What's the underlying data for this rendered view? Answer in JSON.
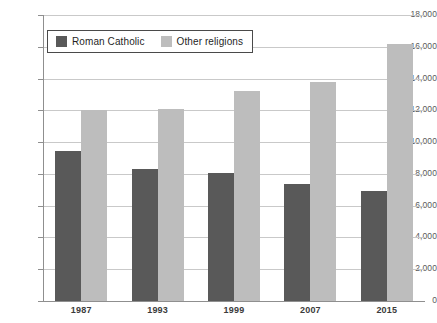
{
  "chart_data": {
    "type": "bar",
    "title": "",
    "xlabel": "",
    "ylabel": "",
    "categories": [
      "1987",
      "1993",
      "1999",
      "2007",
      "2015"
    ],
    "series": [
      {
        "name": "Roman Catholic",
        "color": "#595959",
        "values": [
          9450,
          8300,
          8050,
          7350,
          6900
        ]
      },
      {
        "name": "Other religions",
        "color": "#bdbdbd",
        "values": [
          12050,
          12100,
          13200,
          13800,
          16150
        ]
      }
    ],
    "ylim": [
      0,
      18000
    ],
    "ytick_step": 2000,
    "ytick_labels": [
      "0",
      "2,000",
      "4,000",
      "6,000",
      "8,000",
      "10,000",
      "12,000",
      "14,000",
      "16,000",
      "18,000"
    ],
    "grid": true,
    "legend_position": "top-left"
  },
  "legend": {
    "entries": [
      {
        "label": "Roman Catholic"
      },
      {
        "label": "Other religions"
      }
    ]
  }
}
